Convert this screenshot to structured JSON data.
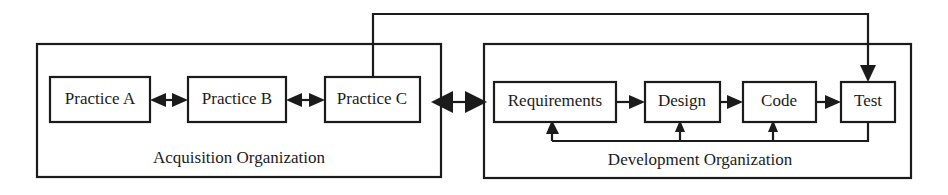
{
  "diagram": {
    "colors": {
      "stroke": "#1b1b1b",
      "background": "#ffffff",
      "box_fill": "#ffffff"
    },
    "groups": [
      {
        "id": "acquisition",
        "label": "Acquisition Organization",
        "x": 37,
        "y": 44,
        "width": 404,
        "height": 133
      },
      {
        "id": "development",
        "label": "Development Organization",
        "x": 484,
        "y": 44,
        "width": 427,
        "height": 134
      }
    ],
    "nodes": [
      {
        "id": "practice-a",
        "label": "Practice A",
        "x": 50,
        "y": 77,
        "width": 100,
        "height": 45
      },
      {
        "id": "practice-b",
        "label": "Practice B",
        "x": 188,
        "y": 77,
        "width": 98,
        "height": 45
      },
      {
        "id": "practice-c",
        "label": "Practice C",
        "x": 325,
        "y": 77,
        "width": 95,
        "height": 45
      },
      {
        "id": "requirements",
        "label": "Requirements",
        "x": 494,
        "y": 82,
        "width": 122,
        "height": 40
      },
      {
        "id": "design",
        "label": "Design",
        "x": 645,
        "y": 82,
        "width": 75,
        "height": 40
      },
      {
        "id": "code",
        "label": "Code",
        "x": 743,
        "y": 82,
        "width": 73,
        "height": 40
      },
      {
        "id": "test",
        "label": "Test",
        "x": 841,
        "y": 82,
        "width": 54,
        "height": 40
      }
    ],
    "connections": [
      {
        "id": "a-to-b",
        "from": "practice-a",
        "to": "practice-b",
        "style": "bidirectional"
      },
      {
        "id": "b-to-c",
        "from": "practice-b",
        "to": "practice-c",
        "style": "bidirectional"
      },
      {
        "id": "acq-to-dev",
        "from": "practice-c",
        "to": "requirements",
        "style": "bidirectional"
      },
      {
        "id": "req-to-design",
        "from": "requirements",
        "to": "design",
        "style": "directed"
      },
      {
        "id": "design-to-code",
        "from": "design",
        "to": "code",
        "style": "directed"
      },
      {
        "id": "code-to-test",
        "from": "code",
        "to": "test",
        "style": "directed"
      },
      {
        "id": "practice-c-to-test",
        "from": "practice-c",
        "to": "test",
        "style": "directed-routed-top"
      },
      {
        "id": "test-to-req",
        "from": "test",
        "to": "requirements",
        "style": "directed-feedback"
      },
      {
        "id": "test-to-design",
        "from": "test",
        "to": "design",
        "style": "directed-feedback"
      },
      {
        "id": "test-to-code",
        "from": "test",
        "to": "code",
        "style": "directed-feedback"
      }
    ]
  }
}
